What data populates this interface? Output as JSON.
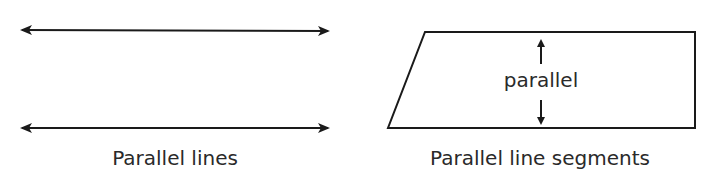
{
  "left_figure": {
    "caption": "Parallel lines"
  },
  "right_figure": {
    "inner_label": "parallel",
    "caption": "Parallel line segments"
  },
  "colors": {
    "stroke": "#1a1a1a",
    "text": "#2a2a2a"
  }
}
